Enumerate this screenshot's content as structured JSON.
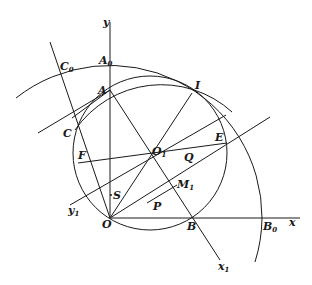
{
  "figure": {
    "axis_labels": {
      "y": "y",
      "x": "x",
      "y1": "y",
      "y1_sub": "1",
      "x1": "x",
      "x1_sub": "1"
    },
    "points": {
      "O": "O",
      "A": "A",
      "A0": "A",
      "A0_sub": "0",
      "B": "B",
      "B0": "B",
      "B0_sub": "0",
      "C": "C",
      "C0": "C",
      "C0_sub": "0",
      "I": "I",
      "E": "E",
      "F": "F",
      "Q": "Q",
      "O1": "O",
      "O1_sub": "1",
      "S": "S",
      "P": "P",
      "M1": "M",
      "M1_sub": "1"
    }
  }
}
